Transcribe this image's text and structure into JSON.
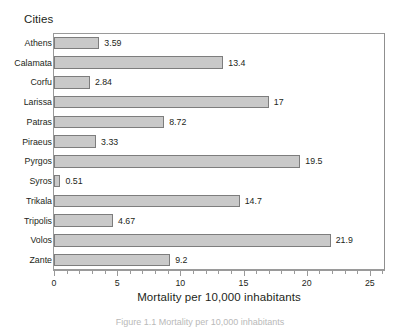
{
  "chart_data": {
    "type": "bar",
    "orientation": "horizontal",
    "title": "",
    "group_title": "Cities",
    "xlabel": "Mortality per 10,000 inhabitants",
    "ylabel": "Cities",
    "categories": [
      "Athens",
      "Calamata",
      "Corfu",
      "Larissa",
      "Patras",
      "Piraeus",
      "Pyrgos",
      "Syros",
      "Trikala",
      "Tripolis",
      "Volos",
      "Zante"
    ],
    "values": [
      3.59,
      13.4,
      2.84,
      17,
      8.72,
      3.33,
      19.5,
      0.51,
      14.7,
      4.67,
      21.9,
      9.2
    ],
    "value_labels": [
      "3.59",
      "13.4",
      "2.84",
      "17",
      "8.72",
      "3.33",
      "19.5",
      "0.51",
      "14.7",
      "4.67",
      "21.9",
      "9.2"
    ],
    "xlim": [
      0,
      26.2
    ],
    "xticks": [
      0,
      5,
      10,
      15,
      20,
      25
    ],
    "xtick_labels": [
      "0",
      "5",
      "10",
      "15",
      "20",
      "25"
    ],
    "minor_tick_step": 1,
    "grid": false,
    "legend": null,
    "bar_fill": "#c9c9c9",
    "bar_edge": "#7d7d7d",
    "frame_color": "#9a9a9a",
    "text_color": "#231f20",
    "background": "#ffffff"
  },
  "caption": {
    "text": "Figure 1.1 Mortality per 10,000 inhabitants"
  }
}
